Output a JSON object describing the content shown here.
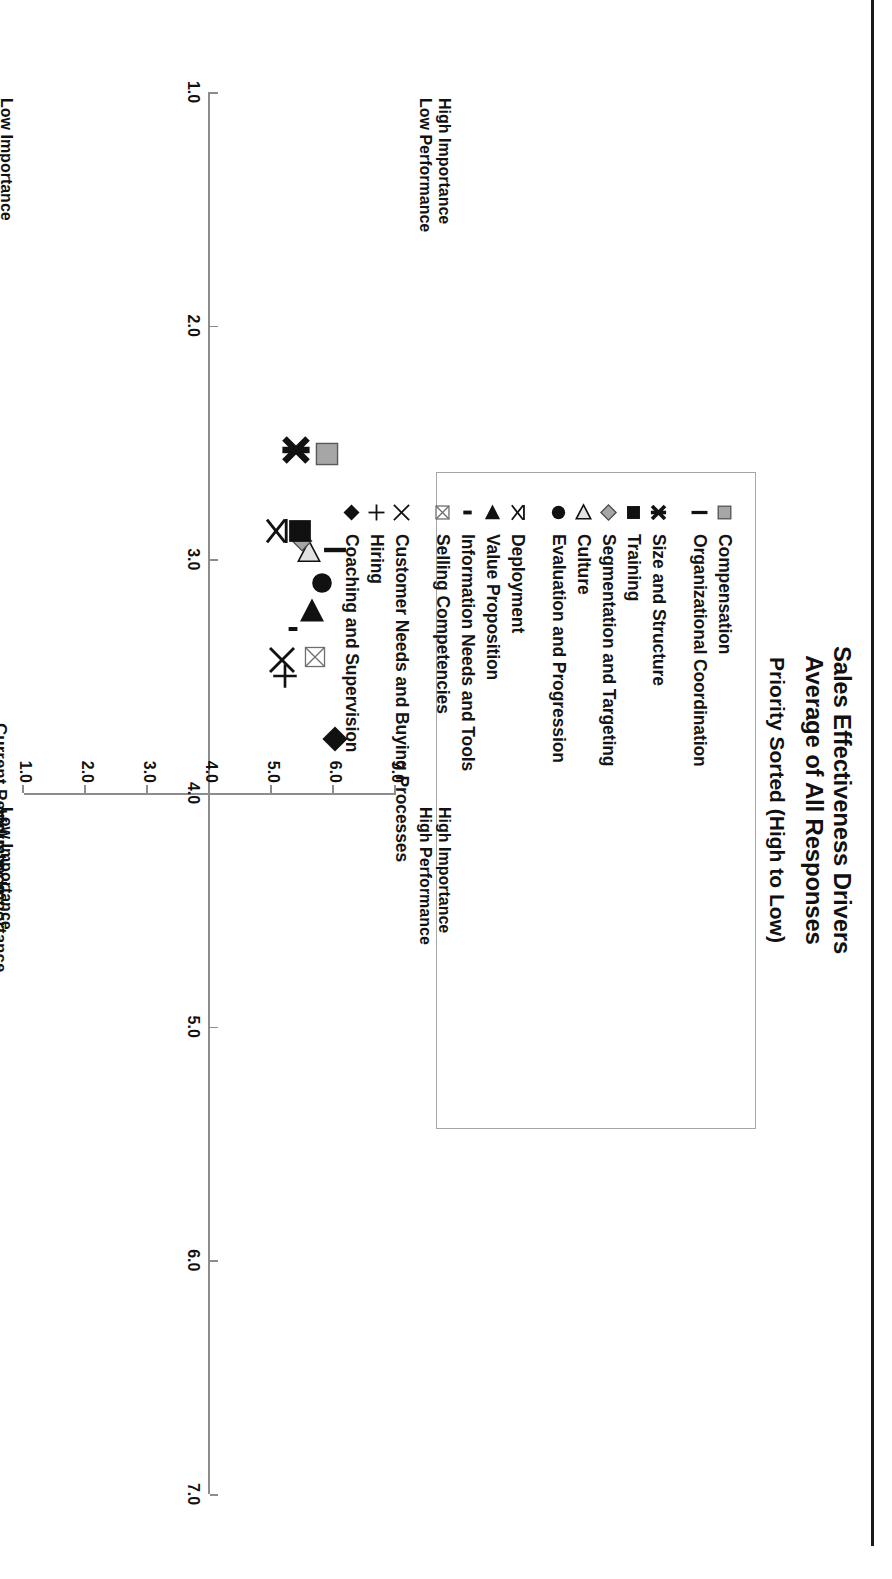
{
  "title": {
    "line1": "Sales Effectiveness Drivers",
    "line2": "Average of All Responses",
    "subtitle": "Priority Sorted (High to Low)"
  },
  "legend": {
    "groups": [
      {
        "items": [
          {
            "label": "Compensation",
            "marker": "gray-square-marker"
          },
          {
            "label": "Organizational Coordination",
            "marker": "black-vbar-marker"
          }
        ]
      },
      {
        "items": [
          {
            "label": "Size and Structure",
            "marker": "black-asterisk-marker"
          },
          {
            "label": "Training",
            "marker": "black-square-marker"
          },
          {
            "label": "Segmentation and Targeting",
            "marker": "gray-diamond-marker"
          },
          {
            "label": "Culture",
            "marker": "open-triangle-left-marker"
          },
          {
            "label": "Evaluation and Progression",
            "marker": "black-circle-marker"
          }
        ]
      },
      {
        "items": [
          {
            "label": "Deployment",
            "marker": "thin-x-star-marker"
          },
          {
            "label": "Value Proposition",
            "marker": "black-triangle-left-marker"
          },
          {
            "label": "Information Needs and Tools",
            "marker": "black-dash-marker"
          },
          {
            "label": "Selling Competencies",
            "marker": "crossed-square-marker"
          }
        ]
      },
      {
        "items": [
          {
            "label": "Customer Needs and Buying Processes",
            "marker": "thin-x-marker"
          },
          {
            "label": "Hiring",
            "marker": "plus-marker"
          },
          {
            "label": "Coaching and Supervision",
            "marker": "black-diamond-marker"
          }
        ]
      }
    ]
  },
  "axes": {
    "x_title": "Current Performance",
    "y_title": "Industry Importance",
    "x_ticks": [
      "1.0",
      "2.0",
      "3.0",
      "4.0",
      "5.0",
      "6.0",
      "7.0"
    ],
    "y_ticks": [
      "1.0",
      "2.0",
      "3.0",
      "4.0",
      "5.0",
      "6.0",
      "7.0"
    ],
    "origin_label": "4.0"
  },
  "quadrants": {
    "top_left": "High Importance\nLow Performance",
    "top_right": "High Importance\nHigh Performance",
    "bottom_left": "Low Importance\nLow Performance",
    "bottom_right": "Low Importance\nHigh Performance",
    "tl_1": "High Importance",
    "tl_2": "Low Performance",
    "tr_1": "High Importance",
    "tr_2": "High Performance",
    "bl_1": "Low Importance",
    "bl_2": "Low Performance",
    "br_1": "Low Importance",
    "br_2": "High Performance"
  },
  "chart_data": {
    "type": "scatter",
    "subtitle": "Priority Sorted (High to Low)",
    "xlabel": "Current Performance",
    "ylabel": "Industry Importance",
    "xlim": [
      1.0,
      7.0
    ],
    "ylim": [
      1.0,
      7.0
    ],
    "grid": false,
    "legend_position": "top",
    "quadrant_divider": {
      "x": 4.0,
      "y": 4.0
    },
    "points": [
      {
        "name": "Coaching and Supervision",
        "x": 3.77,
        "y": 5.98,
        "marker": "black-diamond-marker"
      },
      {
        "name": "Hiring",
        "x": 3.5,
        "y": 5.17,
        "marker": "plus-marker"
      },
      {
        "name": "Customer Needs and Buying Processes",
        "x": 3.43,
        "y": 5.13,
        "marker": "thin-x-marker"
      },
      {
        "name": "Selling Competencies",
        "x": 3.42,
        "y": 5.66,
        "marker": "crossed-square-marker"
      },
      {
        "name": "Information Needs and Tools",
        "x": 3.3,
        "y": 5.3,
        "marker": "black-dash-marker"
      },
      {
        "name": "Value Proposition",
        "x": 3.22,
        "y": 5.62,
        "marker": "black-triangle-left-marker"
      },
      {
        "name": "Evaluation and Progression",
        "x": 3.1,
        "y": 5.78,
        "marker": "black-circle-marker"
      },
      {
        "name": "Culture",
        "x": 2.97,
        "y": 5.57,
        "marker": "open-triangle-left-marker"
      },
      {
        "name": "Organizational Coordination",
        "x": 2.96,
        "y": 5.98,
        "marker": "black-vbar-marker"
      },
      {
        "name": "Segmentation and Targeting",
        "x": 2.92,
        "y": 5.45,
        "marker": "gray-diamond-marker"
      },
      {
        "name": "Training",
        "x": 2.88,
        "y": 5.42,
        "marker": "black-square-marker"
      },
      {
        "name": "Deployment",
        "x": 2.88,
        "y": 5.04,
        "marker": "thin-x-star-marker"
      },
      {
        "name": "Compensation",
        "x": 2.55,
        "y": 5.86,
        "marker": "gray-square-marker"
      },
      {
        "name": "Size and Structure",
        "x": 2.53,
        "y": 5.35,
        "marker": "black-asterisk-marker"
      }
    ]
  },
  "colors": {
    "ink": "#111111",
    "axis": "#8c8c8c",
    "gray_fill": "#a6a6a6",
    "legend_border": "#a6a6a6"
  }
}
